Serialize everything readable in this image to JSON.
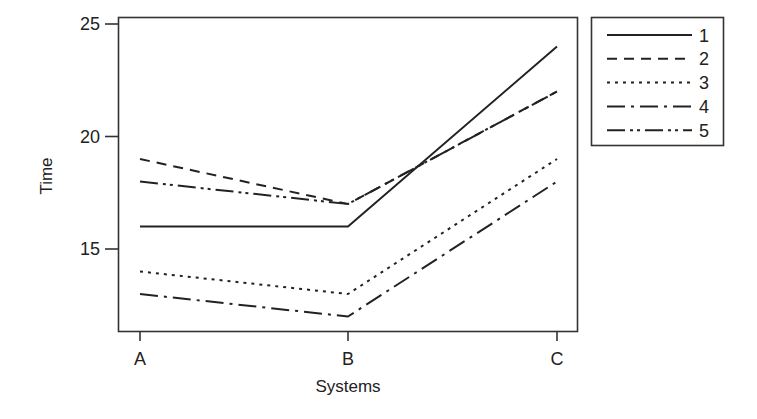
{
  "chart_data": {
    "type": "line",
    "title": "",
    "xlabel": "Systems",
    "ylabel": "Time",
    "categories": [
      "A",
      "B",
      "C"
    ],
    "yticks": [
      15,
      20,
      25
    ],
    "ylim": [
      11.6,
      25.3
    ],
    "grid": false,
    "legend_position": "right-outside-top",
    "series": [
      {
        "name": "1",
        "values": [
          16,
          16,
          24
        ],
        "dash": "solid"
      },
      {
        "name": "2",
        "values": [
          19,
          17,
          22
        ],
        "dash": "dashed"
      },
      {
        "name": "3",
        "values": [
          14,
          13,
          19
        ],
        "dash": "dotted"
      },
      {
        "name": "4",
        "values": [
          13,
          12,
          18
        ],
        "dash": "long-dash-dot"
      },
      {
        "name": "5",
        "values": [
          18,
          17,
          22
        ],
        "dash": "long-dash-dot-dot"
      }
    ]
  },
  "colors": {
    "line": "#222222",
    "axis": "#333333",
    "background": "#ffffff"
  }
}
